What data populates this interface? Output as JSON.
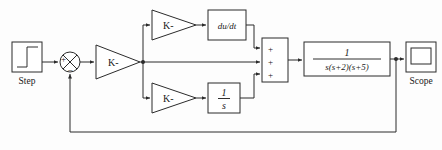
{
  "diagram": {
    "type": "control-system-block-diagram",
    "canvas": {
      "width": 442,
      "height": 150
    },
    "colors": {
      "background": "#fdfdfd",
      "line": "#2b2b2b",
      "text": "#1a1a1a",
      "block_fill": "#ffffff"
    },
    "blocks": {
      "step": {
        "name": "Step",
        "caption": "Step",
        "icon": "step-function-icon",
        "x": 12,
        "y": 42,
        "w": 30,
        "h": 30
      },
      "sum_error": {
        "name": "Sum",
        "icon": "summing-junction-icon",
        "cx": 70,
        "cy": 62,
        "r": 10,
        "signs": [
          {
            "label": "+",
            "port": "left"
          },
          {
            "label": "−",
            "port": "bottom"
          }
        ]
      },
      "gain_main": {
        "name": "Gain",
        "label": "K-",
        "icon": "triangle-gain-icon",
        "x": 96,
        "y": 45,
        "w": 44,
        "h": 34
      },
      "gain_derivative": {
        "name": "Gain1",
        "label": "K-",
        "icon": "triangle-gain-icon",
        "x": 152,
        "y": 10,
        "w": 44,
        "h": 30
      },
      "derivative": {
        "name": "Derivative",
        "label": "du/dt",
        "x": 208,
        "y": 10,
        "w": 38,
        "h": 30
      },
      "gain_integral": {
        "name": "Gain2",
        "label": "K-",
        "icon": "triangle-gain-icon",
        "x": 152,
        "y": 83,
        "w": 44,
        "h": 30
      },
      "integrator": {
        "name": "Integrator",
        "numerator": "1",
        "denominator": "s",
        "x": 208,
        "y": 83,
        "w": 32,
        "h": 30
      },
      "sum_three": {
        "name": "Sum1",
        "x": 262,
        "y": 38,
        "w": 26,
        "h": 44,
        "signs": [
          "+",
          "+",
          "+"
        ]
      },
      "plant": {
        "name": "Transfer Fcn",
        "numerator": "1",
        "denominator": "s(s+2)(s+5)",
        "x": 304,
        "y": 42,
        "w": 86,
        "h": 34
      },
      "scope": {
        "name": "Scope",
        "caption": "Scope",
        "icon": "scope-screen-icon",
        "x": 406,
        "y": 42,
        "w": 30,
        "h": 30
      }
    },
    "signals": {
      "branch_after_gain_x": 143,
      "branch_after_plant_x": 396,
      "feedback_bottom_y": 132,
      "feedback_entry_x": 70
    }
  }
}
